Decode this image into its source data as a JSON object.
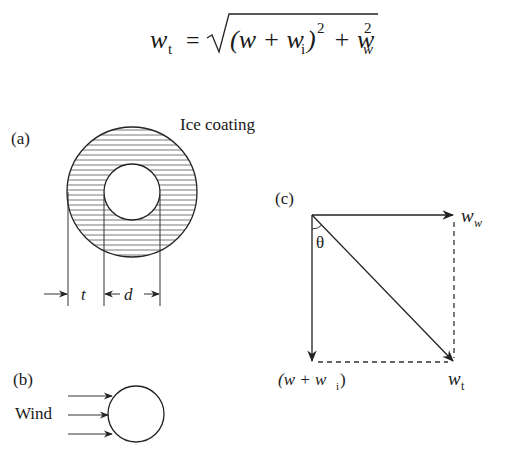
{
  "equation": {
    "lhs": "w",
    "lhs_sub": "t",
    "equals": "=",
    "open": "(w + w",
    "inner_sub": "i",
    "close": ")",
    "sup1": "2",
    "plus": "+ w",
    "last_sub": "w",
    "sup2": "2"
  },
  "panel_a": {
    "label": "(a)",
    "title": "Ice coating",
    "dim_t": "t",
    "dim_d": "d"
  },
  "panel_b": {
    "label": "(b)",
    "wind_label": "Wind"
  },
  "panel_c": {
    "label": "(c)",
    "angle": "θ",
    "ww_base": "w",
    "ww_sub": "w",
    "wt_base": "w",
    "wt_sub": "t",
    "wwi_open": "(w + w",
    "wwi_sub": "i",
    "wwi_close": ")"
  }
}
